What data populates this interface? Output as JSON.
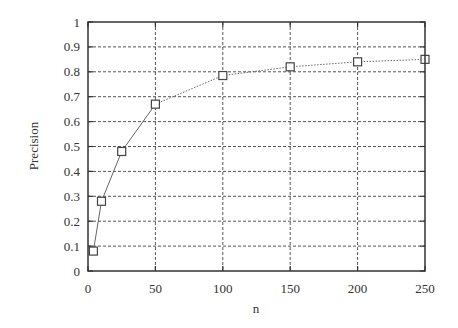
{
  "chart_data": {
    "type": "line",
    "title": "",
    "xlabel": "n",
    "ylabel": "Precision",
    "xlim": [
      0,
      250
    ],
    "ylim": [
      0,
      1
    ],
    "x_ticks": [
      0,
      50,
      100,
      150,
      200,
      250
    ],
    "y_ticks": [
      0,
      0.1,
      0.2,
      0.3,
      0.4,
      0.5,
      0.6,
      0.7,
      0.8,
      0.9,
      1
    ],
    "x_tick_labels": [
      "0",
      "50",
      "100",
      "150",
      "200",
      "250"
    ],
    "y_tick_labels": [
      "0",
      "0.1",
      "0.2",
      "0.3",
      "0.4",
      "0.5",
      "0.6",
      "0.7",
      "0.8",
      "0.9",
      "1"
    ],
    "grid": true,
    "grid_style": "dotted",
    "legend": null,
    "series": [
      {
        "name": "Precision",
        "marker": "square",
        "x": [
          4,
          10,
          25,
          50,
          100,
          150,
          200,
          250
        ],
        "values": [
          0.08,
          0.28,
          0.48,
          0.67,
          0.785,
          0.82,
          0.84,
          0.85
        ]
      }
    ]
  },
  "colors": {
    "axis": "#333333",
    "grid": "#555555",
    "line": "#666666",
    "marker": "#444444"
  }
}
